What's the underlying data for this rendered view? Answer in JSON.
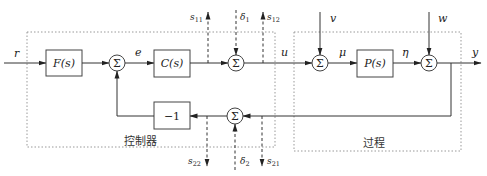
{
  "diagram": {
    "type": "control-block-diagram",
    "groups": {
      "controller": {
        "label": "控制器"
      },
      "process": {
        "label": "过程"
      }
    },
    "blocks": {
      "prefilter": {
        "label": "F(s)"
      },
      "controller_block": {
        "label": "C(s)"
      },
      "plant": {
        "label": "P(s)"
      },
      "negation": {
        "label": "−1"
      }
    },
    "summing_junction_symbol": "Σ",
    "signals": {
      "reference": "r",
      "error": "e",
      "control": "u",
      "load_disturbance": "v",
      "plant_input": "μ",
      "plant_output": "η",
      "measurement_noise": "w",
      "output": "y"
    },
    "test_points": {
      "top": {
        "s11": {
          "base": "s",
          "sub": "11"
        },
        "delta1": {
          "base": "δ",
          "sub": "1"
        },
        "s12": {
          "base": "s",
          "sub": "12"
        }
      },
      "bottom": {
        "s22": {
          "base": "s",
          "sub": "22"
        },
        "delta2": {
          "base": "δ",
          "sub": "2"
        },
        "s21": {
          "base": "s",
          "sub": "21"
        }
      }
    },
    "connections": [
      "r → F(s)",
      "F(s) → Σ1",
      "Σ1 → e → C(s)",
      "C(s) → Σ2",
      "δ1 → Σ2",
      "Σ2 → u → Σ3",
      "v → Σ3",
      "Σ3 → μ → P(s)",
      "P(s) → η → Σ4",
      "w → Σ4",
      "Σ4 → y",
      "y → Σ5 (feedback)",
      "δ2 → Σ5",
      "Σ5 → −1",
      "−1 → Σ1"
    ]
  }
}
